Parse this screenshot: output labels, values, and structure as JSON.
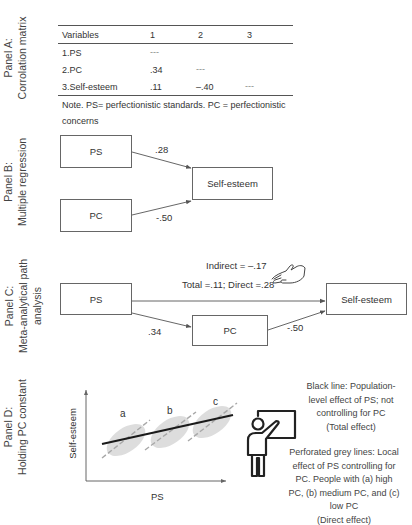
{
  "panels": {
    "a": {
      "label_line1": "Panel A:",
      "label_line2": "Corrolation matrix",
      "table": {
        "headers": [
          "Variables",
          "1",
          "2",
          "3"
        ],
        "rows": [
          {
            "variable": "1.PS",
            "c1": "---",
            "c2": "",
            "c3": ""
          },
          {
            "variable": "2.PC",
            "c1": ".34",
            "c2": "---",
            "c3": ""
          },
          {
            "variable": "3.Self-esteem",
            "c1": ".11",
            "c2": "–.40",
            "c3": "---"
          }
        ]
      },
      "note_line1": "Note. PS= perfectionistic standards. PC = perfectionistic",
      "note_line2": "concerns"
    },
    "b": {
      "label_line1": "Panel B:",
      "label_line2": "Multiple regression",
      "nodes": {
        "ps": "PS",
        "pc": "PC",
        "outcome": "Self-esteem"
      },
      "coefficients": {
        "ps_to_outcome": ".28",
        "pc_to_outcome": "-.50"
      }
    },
    "c": {
      "label_line1": "Panel C:",
      "label_line2": "Meta-analytical path",
      "label_line3": "analysis",
      "nodes": {
        "ps": "PS",
        "pc": "PC",
        "outcome": "Self-esteem"
      },
      "indirect_label": "Indirect = –.17",
      "total_direct_label": "Total =.11; Direct =.28",
      "coefficients": {
        "ps_to_pc": ".34",
        "pc_to_outcome": "-.50"
      },
      "pointer_icon": "pointing-hand-icon"
    },
    "d": {
      "label_line1": "Panel D:",
      "label_line2": "Holding PC constant",
      "x_axis_label": "PS",
      "y_axis_label": "Self-esteem",
      "group_labels": [
        "a",
        "b",
        "c"
      ],
      "presenter_icon": "teacher-at-board-icon",
      "legend_black": [
        "Black line: Population-",
        "level effect of PS; not",
        "controlling for PC",
        "(Total effect)"
      ],
      "legend_grey": [
        "Perforated grey lines: Local",
        "effect of PS controlling for",
        "PC. People with (a) high",
        "PC, (b) medium PC, and (c)",
        "low PC",
        "(Direct effect)"
      ]
    }
  },
  "colors": {
    "text": "#333333",
    "line": "#555555",
    "total_effect_line": "#1a1a1a",
    "dashed_line": "#a8a8a8",
    "scatter": "#d6d6d6"
  }
}
